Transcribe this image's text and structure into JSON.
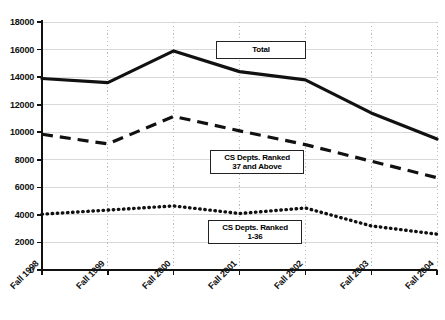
{
  "chart_data": {
    "type": "line",
    "title": "",
    "subtitle": "",
    "xlabel": "",
    "ylabel": "",
    "categories": [
      "Fall 1998",
      "Fall 1999",
      "Fall 2000",
      "Fall 2001",
      "Fall 2002",
      "Fall 2003",
      "Fall 2004"
    ],
    "ylim": [
      0,
      18000
    ],
    "ytick_values": [
      0,
      2000,
      4000,
      6000,
      8000,
      10000,
      12000,
      14000,
      16000,
      18000
    ],
    "ytick_labels": [
      "0",
      "2000",
      "4000",
      "6000",
      "8000",
      "10000",
      "12000",
      "14000",
      "16000",
      "18000"
    ],
    "grid": {
      "horizontal": true,
      "horizontal_style": "solid-light",
      "vertical": true,
      "vertical_style": "dotted"
    },
    "legend": {
      "position": "inline-boxed-labels"
    },
    "series": [
      {
        "name": "Total",
        "line_style": "solid",
        "color": "#111111",
        "values": [
          13900,
          13600,
          15900,
          14400,
          13800,
          11400,
          9500
        ]
      },
      {
        "name": "CS Depts. Ranked 37 and Above",
        "line_style": "dashed",
        "color": "#111111",
        "values": [
          9850,
          9150,
          11150,
          10100,
          9100,
          7900,
          6700
        ]
      },
      {
        "name": "CS Depts. Ranked 1-36",
        "line_style": "dotted",
        "color": "#111111",
        "values": [
          4050,
          4350,
          4650,
          4100,
          4500,
          3200,
          2600
        ]
      }
    ],
    "annotations": [
      {
        "text_line1": "Total",
        "text_line2": ""
      },
      {
        "text_line1": "CS Depts. Ranked",
        "text_line2": "37 and Above"
      },
      {
        "text_line1": "CS Depts. Ranked",
        "text_line2": "1-36"
      }
    ]
  },
  "axis": {
    "y_labels": [
      "18000",
      "16000",
      "14000",
      "12000",
      "10000",
      "8000",
      "6000",
      "4000",
      "2000",
      "0"
    ],
    "x_labels": [
      "Fall 1998",
      "Fall 1999",
      "Fall 2000",
      "Fall 2001",
      "Fall 2002",
      "Fall 2003",
      "Fall 2004"
    ]
  },
  "labels": {
    "total_line1": "Total",
    "ranked37_line1": "CS Depts. Ranked",
    "ranked37_line2": "37 and Above",
    "ranked136_line1": "CS Depts. Ranked",
    "ranked136_line2": "1-36"
  },
  "colors": {
    "ink": "#111111",
    "gridline": "#d9d9d9",
    "background": "#ffffff"
  }
}
